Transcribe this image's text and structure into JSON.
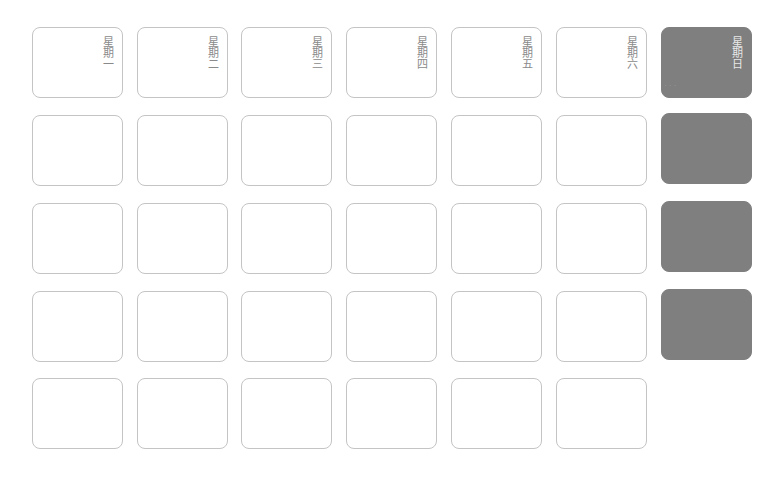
{
  "calendar": {
    "weekdays": [
      "星期一",
      "星期二",
      "星期三",
      "星期四",
      "星期五",
      "星期六",
      "星期日"
    ],
    "header_labels_as_rendered": [
      "星期一",
      "星期二",
      "星期三",
      "星期四",
      "星期五",
      "星期六",
      "星期日"
    ],
    "rows": 5,
    "columns": 7,
    "sunday_highlight_color": "#7f7f7f",
    "card_border_color": "#c4c4c4",
    "sunday_faint_text": "...",
    "sunday_rows_present": 4,
    "last_row_cells": 6
  }
}
